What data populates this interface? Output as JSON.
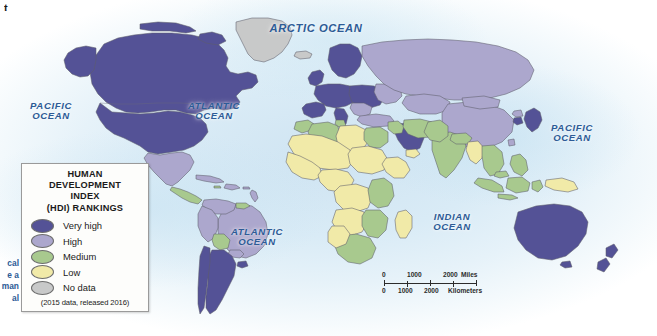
{
  "map": {
    "title": "World Human Development Index (HDI) Rankings Map",
    "projection": "world-robinson",
    "corner_mark": "t"
  },
  "legend": {
    "title": "HUMAN\nDEVELOPMENT\nINDEX\n(HDI) RANKINGS",
    "note": "(2015 data, released 2016)",
    "items": [
      {
        "label": "Very high",
        "color": "#545296"
      },
      {
        "label": "High",
        "color": "#aca7cd"
      },
      {
        "label": "Medium",
        "color": "#a8c98e"
      },
      {
        "label": "Low",
        "color": "#f1eaa8"
      },
      {
        "label": "No data",
        "color": "#c8c9c9"
      }
    ]
  },
  "ocean_labels": [
    {
      "name": "arctic-ocean",
      "text": "ARCTIC  OCEAN",
      "x": 316,
      "y": 28,
      "size": 11.2
    },
    {
      "name": "pacific-ocean-west",
      "text": "PACIFIC\nOCEAN",
      "x": 46,
      "y": 108,
      "size": 9.6
    },
    {
      "name": "atlantic-ocean-north",
      "text": "ATLANTIC\nOCEAN",
      "x": 212,
      "y": 108,
      "size": 9.6
    },
    {
      "name": "atlantic-ocean-south",
      "text": "ATLANTIC\nOCEAN",
      "x": 255,
      "y": 234,
      "size": 9.6
    },
    {
      "name": "indian-ocean",
      "text": "INDIAN\nOCEAN",
      "x": 451,
      "y": 219,
      "size": 9.6
    },
    {
      "name": "pacific-ocean-east",
      "text": "PACIFIC\nOCEAN",
      "x": 570,
      "y": 130,
      "size": 9.6
    }
  ],
  "scale_bar": {
    "miles": {
      "ticks": [
        "0",
        "1000",
        "2000"
      ],
      "unit": "Miles"
    },
    "kilometers": {
      "ticks": [
        "0",
        "1000",
        "2000"
      ],
      "unit": "Kilometers"
    }
  },
  "margin_text": {
    "lines": [
      "cal",
      "e a",
      "man",
      "al"
    ]
  },
  "colors": {
    "very_high": "#545296",
    "high": "#aca7cd",
    "medium": "#a8c98e",
    "low": "#f1eaa8",
    "no_data": "#c8c9c9",
    "ocean": "#d9ebf6",
    "border": "#5d5d6b",
    "label_blue": "#2d5b96"
  },
  "regions": [
    {
      "name": "canada",
      "level": "very_high"
    },
    {
      "name": "united-states",
      "level": "very_high"
    },
    {
      "name": "greenland",
      "level": "no_data"
    },
    {
      "name": "mexico",
      "level": "high"
    },
    {
      "name": "central-america",
      "level": "medium"
    },
    {
      "name": "caribbean",
      "level": "high"
    },
    {
      "name": "brazil",
      "level": "high"
    },
    {
      "name": "argentina",
      "level": "very_high"
    },
    {
      "name": "chile",
      "level": "very_high"
    },
    {
      "name": "bolivia",
      "level": "medium"
    },
    {
      "name": "guyana-region",
      "level": "medium"
    },
    {
      "name": "western-europe",
      "level": "very_high"
    },
    {
      "name": "eastern-europe",
      "level": "very_high"
    },
    {
      "name": "russia",
      "level": "high"
    },
    {
      "name": "north-africa",
      "level": "medium"
    },
    {
      "name": "sub-saharan-africa",
      "level": "low"
    },
    {
      "name": "southern-africa",
      "level": "medium"
    },
    {
      "name": "middle-east",
      "level": "very_high"
    },
    {
      "name": "central-asia",
      "level": "high"
    },
    {
      "name": "india",
      "level": "medium"
    },
    {
      "name": "china",
      "level": "high"
    },
    {
      "name": "southeast-asia",
      "level": "medium"
    },
    {
      "name": "myanmar",
      "level": "low"
    },
    {
      "name": "japan",
      "level": "very_high"
    },
    {
      "name": "australia",
      "level": "very_high"
    },
    {
      "name": "new-zealand",
      "level": "very_high"
    },
    {
      "name": "papua-new-guinea",
      "level": "low"
    }
  ]
}
